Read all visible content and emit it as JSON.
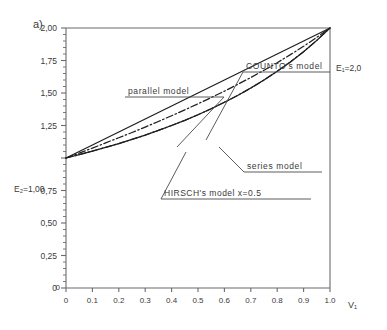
{
  "figure": {
    "panel_label": "a)"
  },
  "chart_data": {
    "type": "line",
    "title": "",
    "subtitle": "",
    "xlabel": "V₁",
    "ylabel": "",
    "xlim": [
      0,
      1.0
    ],
    "ylim": [
      0,
      2.0
    ],
    "grid": false,
    "legend_position": "inline-annotations",
    "x_ticks": [
      "0",
      "0.1",
      "0.2",
      "0.3",
      "0.4",
      "0.5",
      "0.6",
      "0.7",
      "0.8",
      "0.9",
      "1.0"
    ],
    "x_tick_values": [
      0,
      0.1,
      0.2,
      0.3,
      0.4,
      0.5,
      0.6,
      0.7,
      0.8,
      0.9,
      1.0
    ],
    "y_ticks": [
      "0",
      "0,25",
      "0,50",
      "0,75",
      "1,00",
      "1,25",
      "1,50",
      "1,75",
      "2,00"
    ],
    "y_tick_values": [
      0,
      0.25,
      0.5,
      0.75,
      1.0,
      1.25,
      1.5,
      1.75,
      2.0
    ],
    "y_minor_tick_step": 0.05,
    "endpoint_labels": {
      "upper_right": "E₁=2,0",
      "left_axis": "E₂=1,00"
    },
    "x": [
      0,
      0.05,
      0.1,
      0.15,
      0.2,
      0.25,
      0.3,
      0.35,
      0.4,
      0.45,
      0.5,
      0.55,
      0.6,
      0.65,
      0.7,
      0.75,
      0.8,
      0.85,
      0.9,
      0.95,
      1.0
    ],
    "series": [
      {
        "name": "parallel model",
        "style": "solid",
        "values": [
          1.0,
          1.05,
          1.1,
          1.15,
          1.2,
          1.25,
          1.3,
          1.35,
          1.4,
          1.45,
          1.5,
          1.55,
          1.6,
          1.65,
          1.7,
          1.75,
          1.8,
          1.85,
          1.9,
          1.95,
          2.0
        ]
      },
      {
        "name": "COUNTO's model",
        "style": "dash-dot",
        "values": [
          1.0,
          1.026,
          1.053,
          1.082,
          1.111,
          1.143,
          1.176,
          1.212,
          1.25,
          1.29,
          1.333,
          1.379,
          1.429,
          1.481,
          1.538,
          1.6,
          1.667,
          1.739,
          1.818,
          1.905,
          2.0
        ]
      },
      {
        "name": "HIRSCH's model  x=0.5",
        "style": "dash-dot",
        "values": [
          1.0,
          1.038,
          1.076,
          1.116,
          1.156,
          1.196,
          1.238,
          1.281,
          1.325,
          1.37,
          1.417,
          1.465,
          1.514,
          1.566,
          1.619,
          1.675,
          1.733,
          1.795,
          1.859,
          1.928,
          2.0
        ]
      },
      {
        "name": "series model",
        "style": "solid",
        "values": [
          1.0,
          1.026,
          1.053,
          1.081,
          1.111,
          1.143,
          1.176,
          1.212,
          1.25,
          1.29,
          1.333,
          1.379,
          1.429,
          1.481,
          1.538,
          1.6,
          1.667,
          1.739,
          1.818,
          1.905,
          2.0
        ]
      }
    ],
    "annotations": [
      {
        "text": "parallel model",
        "target_x": 0.42,
        "target_y": 1.42
      },
      {
        "text": "COUNTO's model",
        "target_x": 0.43,
        "target_y": 1.33
      },
      {
        "text": "series model",
        "target_x": 0.8,
        "target_y": 1.57
      },
      {
        "text": "HIRSCH's model  x=0.5",
        "target_x": 0.47,
        "target_y": 1.38
      }
    ]
  }
}
